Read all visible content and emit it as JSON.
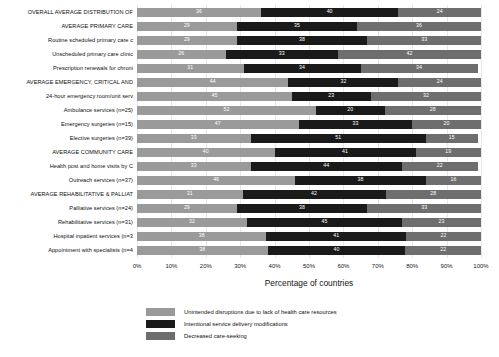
{
  "chart_data": {
    "type": "bar",
    "orientation": "horizontal",
    "stacked": true,
    "normalized_percent": true,
    "title": "",
    "xlabel": "Percentage of countries",
    "ylabel": "",
    "xlim": [
      0,
      100
    ],
    "grid": true,
    "legend_position": "bottom",
    "xticks": [
      "0%",
      "10%",
      "20%",
      "30%",
      "40%",
      "50%",
      "60%",
      "70%",
      "80%",
      "90%",
      "100%"
    ],
    "xtick_values": [
      0,
      10,
      20,
      30,
      40,
      50,
      60,
      70,
      80,
      90,
      100
    ],
    "series": [
      {
        "name": "Unintended disruptions due to lack of health care resources",
        "color": "#9a9a9a",
        "values": [
          36,
          29,
          29,
          26,
          31,
          44,
          45,
          52,
          47,
          33,
          40,
          33,
          46,
          31,
          29,
          32,
          38,
          38
        ]
      },
      {
        "name": "Intentional service delivery modifications",
        "color": "#1a1a1a",
        "values": [
          40,
          35,
          38,
          33,
          34,
          32,
          23,
          20,
          33,
          51,
          41,
          44,
          38,
          42,
          38,
          45,
          41,
          40
        ]
      },
      {
        "name": "Decreased care-seeking",
        "color": "#6e6e6e",
        "values": [
          24,
          36,
          33,
          42,
          34,
          24,
          32,
          28,
          20,
          15,
          19,
          22,
          16,
          28,
          33,
          23,
          22,
          22
        ]
      }
    ],
    "categories": [
      "OVERALL AVERAGE DISTRIBUTION OF",
      "AVERAGE PRIMARY CARE",
      "Routine scheduled primary care c",
      "Unscheduled primary care clinic",
      "Prescription renewals for chroni",
      "AVERAGE EMERGENCY, CRITICAL AND",
      "24-hour emergency room/unit serv",
      "Ambulance services (n=25)",
      "Emergency surgeries (n=15)",
      "Elective surgeries (n=39)",
      "AVERAGE COMMUNITY CARE",
      "Health post and home visits by C",
      "Outreach services (n=37)",
      "AVERAGE REHABILITATIVE & PALLIAT",
      "Palliative services (n=24)",
      "Rehabilitative services (n=31)",
      "Hospital inpatient services (n=3",
      "Appointment with specialists (n=4"
    ]
  }
}
